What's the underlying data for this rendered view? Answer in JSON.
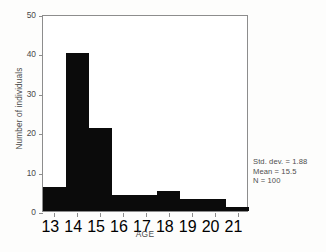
{
  "chart_data": {
    "type": "bar",
    "title": "",
    "xlabel": "AGE",
    "ylabel": "Number of individuals",
    "categories": [
      "13",
      "14",
      "15",
      "16",
      "17",
      "18",
      "19",
      "20",
      "21"
    ],
    "values": [
      6,
      40,
      21,
      4,
      4,
      5,
      3,
      3,
      1
    ],
    "xlim": [
      12.5,
      21.5
    ],
    "ylim": [
      0,
      50
    ],
    "yticks": [
      0,
      10,
      20,
      30,
      40,
      50
    ],
    "xticks": [
      13,
      14,
      15,
      16,
      17,
      18,
      19,
      20,
      21
    ],
    "grid": false,
    "legend": null,
    "bar_color": "#0b0b0b",
    "bar_width": 1,
    "annotations": [
      "Std. dev. = 1.88",
      "Mean = 15.5",
      "N = 100"
    ]
  },
  "stats": {
    "std_dev_line": "Std. dev. = 1.88",
    "mean_line": "Mean = 15.5",
    "n_line": "N = 100"
  },
  "axes": {
    "x_title": "AGE",
    "y_title": "Number of individuals",
    "y_tick_labels": [
      "0",
      "10",
      "20",
      "30",
      "40",
      "50"
    ],
    "x_tick_labels": [
      "13",
      "14",
      "15",
      "16",
      "17",
      "18",
      "19",
      "20",
      "21"
    ]
  }
}
